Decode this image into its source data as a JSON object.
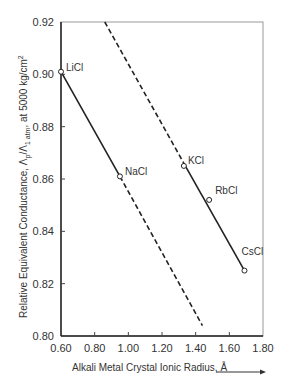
{
  "chart_data": {
    "type": "line",
    "title": "",
    "xlabel": "Alkali Metal Crystal Ionic Radius, Å",
    "ylabel": "Relative Equivalent Conductance, Λp/Λ1 atm, at 5000 kg/cm²",
    "ylabel_parts": {
      "main": "Relative Equivalent Conductance, ",
      "lambda": "Λ",
      "sub_p": "p",
      "slash": "/",
      "sub_1atm": "1 atm",
      "at": ", at 5000 kg/cm",
      "sup2": "2"
    },
    "xlim": [
      0.6,
      1.8
    ],
    "ylim": [
      0.8,
      0.92
    ],
    "x_ticks": [
      "0.60",
      "0.80",
      "1.00",
      "1.20",
      "1.40",
      "1.60",
      "1.80"
    ],
    "y_ticks": [
      "0.80",
      "0.82",
      "0.84",
      "0.86",
      "0.88",
      "0.90",
      "0.92"
    ],
    "grid": false,
    "points": [
      {
        "label": "LiCl",
        "x": 0.6,
        "y": 0.901
      },
      {
        "label": "NaCl",
        "x": 0.95,
        "y": 0.861
      },
      {
        "label": "KCl",
        "x": 1.33,
        "y": 0.865
      },
      {
        "label": "RbCl",
        "x": 1.48,
        "y": 0.852
      },
      {
        "label": "CsCl",
        "x": 1.69,
        "y": 0.825
      }
    ],
    "series": [
      {
        "name": "LiCl-NaCl trend",
        "solid": [
          [
            0.6,
            0.901
          ],
          [
            0.95,
            0.861
          ]
        ],
        "dashed": [
          [
            0.95,
            0.861
          ],
          [
            1.44,
            0.804
          ]
        ]
      },
      {
        "name": "KCl-RbCl-CsCl trend",
        "dashed": [
          [
            0.86,
            0.92
          ],
          [
            1.33,
            0.866
          ]
        ],
        "solid": [
          [
            1.33,
            0.866
          ],
          [
            1.69,
            0.825
          ]
        ]
      }
    ]
  }
}
